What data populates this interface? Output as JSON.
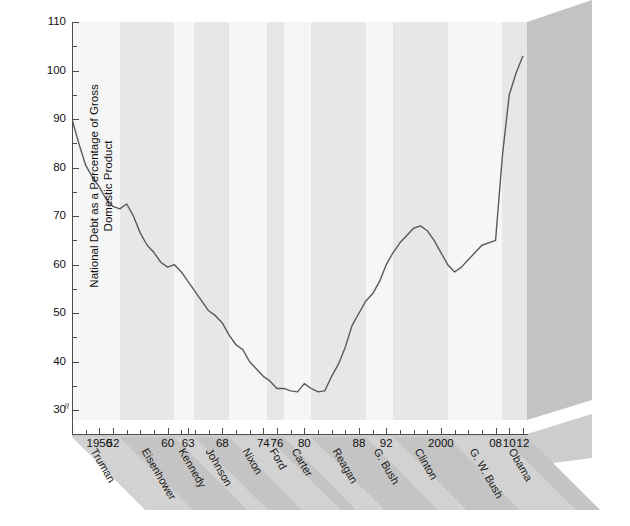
{
  "chart_data": {
    "type": "line",
    "title": "",
    "xlabel": "",
    "ylabel": "National Debt as a Percentage of Gross Domestic Product",
    "ylim": [
      28,
      110
    ],
    "xlim": [
      1946,
      2012.6
    ],
    "y_break_below": 30,
    "grid": false,
    "legend": "none",
    "y_ticks": [
      30,
      40,
      50,
      60,
      70,
      80,
      90,
      100,
      110
    ],
    "y_tick_labels": [
      "30",
      "40",
      "50",
      "60",
      "70",
      "80",
      "90",
      "100",
      "110"
    ],
    "x_tick_labels": [
      {
        "year": 1950,
        "label": "1950"
      },
      {
        "year": 1952,
        "label": "52"
      },
      {
        "year": 1960,
        "label": "60"
      },
      {
        "year": 1963,
        "label": "63"
      },
      {
        "year": 1968,
        "label": "68"
      },
      {
        "year": 1974,
        "label": "74"
      },
      {
        "year": 1976,
        "label": "76"
      },
      {
        "year": 1980,
        "label": "80"
      },
      {
        "year": 1988,
        "label": "88"
      },
      {
        "year": 1992,
        "label": "92"
      },
      {
        "year": 2000,
        "label": "2000"
      },
      {
        "year": 2008,
        "label": "08"
      },
      {
        "year": 2010,
        "label": "10"
      },
      {
        "year": 2012,
        "label": "12"
      }
    ],
    "x_tick_minor_years": [
      1948,
      1954,
      1956,
      1958,
      1962,
      1964,
      1966,
      1970,
      1972,
      1978,
      1982,
      1984,
      1986,
      1990,
      1994,
      1996,
      1998,
      2002,
      2004,
      2006
    ],
    "series": [
      {
        "name": "National Debt as % of GDP",
        "color": "#5a5a5a",
        "x": [
          1946,
          1947,
          1948,
          1949,
          1950,
          1951,
          1952,
          1953,
          1954,
          1955,
          1956,
          1957,
          1958,
          1959,
          1960,
          1961,
          1962,
          1963,
          1964,
          1965,
          1966,
          1967,
          1968,
          1969,
          1970,
          1971,
          1972,
          1973,
          1974,
          1975,
          1976,
          1977,
          1978,
          1979,
          1980,
          1981,
          1982,
          1983,
          1984,
          1985,
          1986,
          1987,
          1988,
          1989,
          1990,
          1991,
          1992,
          1993,
          1994,
          1995,
          1996,
          1997,
          1998,
          1999,
          2000,
          2001,
          2002,
          2003,
          2004,
          2005,
          2006,
          2007,
          2008,
          2009,
          2010,
          2011,
          2012
        ],
        "y": [
          90.0,
          85.0,
          80.5,
          78.0,
          76.0,
          73.5,
          72.0,
          71.5,
          72.5,
          70.0,
          66.5,
          64.0,
          62.5,
          60.5,
          59.5,
          60.0,
          58.5,
          56.5,
          54.5,
          52.5,
          50.5,
          49.5,
          48.0,
          45.5,
          43.5,
          42.5,
          40.0,
          38.5,
          37.0,
          36.0,
          34.5,
          34.5,
          34.0,
          33.8,
          35.5,
          34.5,
          33.8,
          34.0,
          37.0,
          39.5,
          43.0,
          47.5,
          50.0,
          52.5,
          54.0,
          56.5,
          60.0,
          62.5,
          64.5,
          66.0,
          67.5,
          68.0,
          67.0,
          65.0,
          62.5,
          60.0,
          58.5,
          59.5,
          61.0,
          62.5,
          64.0,
          64.5,
          65.0,
          82.5,
          95.0,
          99.5,
          103.0
        ]
      }
    ],
    "presidential_terms": [
      {
        "name": "Truman",
        "start": 1946,
        "end": 1953,
        "shade": "light"
      },
      {
        "name": "Eisenhower",
        "start": 1953,
        "end": 1961,
        "shade": "dark"
      },
      {
        "name": "Kennedy",
        "start": 1961,
        "end": 1963.9,
        "shade": "light"
      },
      {
        "name": "Johnson",
        "start": 1963.9,
        "end": 1969,
        "shade": "dark"
      },
      {
        "name": "Nixon",
        "start": 1969,
        "end": 1974.6,
        "shade": "light"
      },
      {
        "name": "Ford",
        "start": 1974.6,
        "end": 1977,
        "shade": "dark"
      },
      {
        "name": "Carter",
        "start": 1977,
        "end": 1981,
        "shade": "light"
      },
      {
        "name": "Reagan",
        "start": 1981,
        "end": 1989,
        "shade": "dark"
      },
      {
        "name": "G. Bush",
        "start": 1989,
        "end": 1993,
        "shade": "light"
      },
      {
        "name": "Clinton",
        "start": 1993,
        "end": 2001,
        "shade": "dark"
      },
      {
        "name": "G. W. Bush",
        "start": 2001,
        "end": 2009,
        "shade": "light"
      },
      {
        "name": "Obama",
        "start": 2009,
        "end": 2012.6,
        "shade": "dark"
      }
    ],
    "axis_break_symbol": "≈"
  },
  "colors": {
    "band_light": "#f6f6f6",
    "band_dark": "#e7e7e7",
    "plot_bg": "#f2f2f2",
    "line": "#5a5a5a",
    "axis": "#4d4d4d",
    "side_wall": "#c3c3c3",
    "side_wall_edge": "#d8d8d8",
    "floor_light": "#d2d2d2",
    "floor_dark": "#c4c4c4",
    "text": "#111111"
  },
  "caption": ""
}
